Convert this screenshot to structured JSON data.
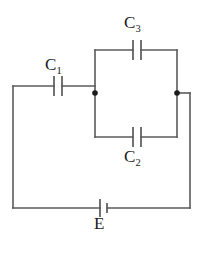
{
  "diagram": {
    "type": "electrical-circuit-schematic",
    "background_color": "#ffffff",
    "wire_color": "#5a5a5a",
    "label_color": "#1a1a1a",
    "node_color": "#1c1c1c"
  },
  "labels": {
    "c1": "C",
    "c1_sub": "1",
    "c2": "C",
    "c2_sub": "2",
    "c3": "C",
    "c3_sub": "3",
    "battery": "E"
  },
  "components": [
    {
      "name": "capacitor-c1",
      "label": "C1",
      "kind": "capacitor",
      "orientation": "vertical-plates",
      "position": "top-left-branch"
    },
    {
      "name": "capacitor-c3",
      "label": "C3",
      "kind": "capacitor",
      "orientation": "vertical-plates",
      "position": "parallel-box-top-branch"
    },
    {
      "name": "capacitor-c2",
      "label": "C2",
      "kind": "capacitor",
      "orientation": "vertical-plates",
      "position": "parallel-box-bottom-branch"
    },
    {
      "name": "battery-e",
      "label": "E",
      "kind": "battery-cell",
      "orientation": "vertical-plates",
      "position": "bottom-branch-center"
    }
  ],
  "nodes": [
    {
      "name": "junction-left",
      "x": 95,
      "y": 93
    },
    {
      "name": "junction-right",
      "x": 177,
      "y": 93
    }
  ]
}
